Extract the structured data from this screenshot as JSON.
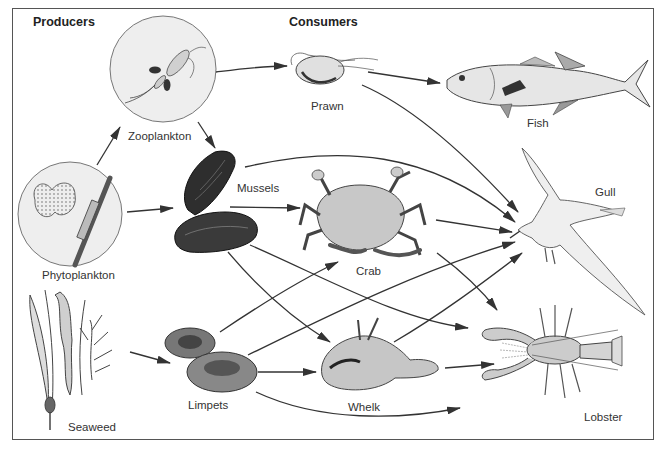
{
  "headings": {
    "producers": "Producers",
    "consumers": "Consumers"
  },
  "organisms": {
    "zooplankton": "Zooplankton",
    "phytoplankton": "Phytoplankton",
    "seaweed": "Seaweed",
    "prawn": "Prawn",
    "fish": "Fish",
    "mussels": "Mussels",
    "crab": "Crab",
    "gull": "Gull",
    "limpets": "Limpets",
    "whelk": "Whelk",
    "lobster": "Lobster"
  },
  "links": [
    {
      "from": "Phytoplankton",
      "to": "Zooplankton"
    },
    {
      "from": "Phytoplankton",
      "to": "Mussels"
    },
    {
      "from": "Zooplankton",
      "to": "Prawn"
    },
    {
      "from": "Zooplankton",
      "to": "Mussels"
    },
    {
      "from": "Prawn",
      "to": "Fish"
    },
    {
      "from": "Prawn",
      "to": "Gull"
    },
    {
      "from": "Mussels",
      "to": "Gull"
    },
    {
      "from": "Mussels",
      "to": "Crab"
    },
    {
      "from": "Mussels",
      "to": "Whelk"
    },
    {
      "from": "Mussels",
      "to": "Lobster"
    },
    {
      "from": "Crab",
      "to": "Gull"
    },
    {
      "from": "Crab",
      "to": "Lobster"
    },
    {
      "from": "Seaweed",
      "to": "Limpets"
    },
    {
      "from": "Limpets",
      "to": "Crab"
    },
    {
      "from": "Limpets",
      "to": "Gull"
    },
    {
      "from": "Limpets",
      "to": "Whelk"
    },
    {
      "from": "Limpets",
      "to": "Lobster"
    },
    {
      "from": "Whelk",
      "to": "Gull"
    },
    {
      "from": "Whelk",
      "to": "Lobster"
    }
  ]
}
